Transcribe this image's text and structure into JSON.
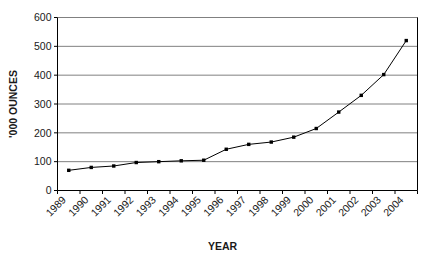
{
  "chart_data": {
    "type": "line",
    "title": "",
    "xlabel": "YEAR",
    "ylabel": "'000 OUNCES",
    "categories": [
      "1989",
      "1990",
      "1991",
      "1992",
      "1993",
      "1994",
      "1995",
      "1996",
      "1997",
      "1998",
      "1999",
      "2000",
      "2001",
      "2002",
      "2003",
      "2004"
    ],
    "values": [
      70,
      80,
      85,
      97,
      100,
      103,
      105,
      143,
      160,
      168,
      185,
      215,
      272,
      330,
      402,
      520
    ],
    "series": [
      {
        "name": "",
        "values": [
          70,
          80,
          85,
          97,
          100,
          103,
          105,
          143,
          160,
          168,
          185,
          215,
          272,
          330,
          402,
          520
        ]
      }
    ],
    "ylim": [
      0,
      600
    ],
    "yticks": [
      0,
      100,
      200,
      300,
      400,
      500,
      600
    ],
    "ytick_labels": [
      "0",
      "100",
      "200",
      "300",
      "400",
      "500",
      "600"
    ],
    "xtick_labels": [
      "1989",
      "1990",
      "1991",
      "1992",
      "1993",
      "1994",
      "1995",
      "1996",
      "1997",
      "1998",
      "1999",
      "2000",
      "2001",
      "2002",
      "2003",
      "2004"
    ],
    "grid": true,
    "grid_axis": "y",
    "legend": false,
    "legend_position": "none",
    "marker": "square",
    "line_color": "#000000",
    "marker_color": "#000000",
    "grid_color": "#808080",
    "axis_color": "#000000",
    "background_color": "#ffffff"
  }
}
